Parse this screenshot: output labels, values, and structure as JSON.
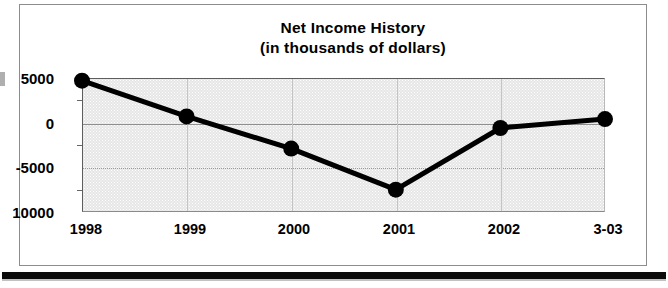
{
  "chart_data": {
    "type": "line",
    "title": "Net Income History",
    "subtitle": "(in thousands of dollars)",
    "xlabel": "",
    "ylabel": "",
    "categories": [
      "1998",
      "1999",
      "2000",
      "2001",
      "2002",
      "3-03"
    ],
    "values": [
      4700,
      700,
      -2900,
      -7500,
      -600,
      400
    ],
    "series": [
      {
        "name": "Net Income",
        "values": [
          4700,
          700,
          -2900,
          -7500,
          -600,
          400
        ]
      }
    ],
    "ylim": [
      -10000,
      5000
    ],
    "ytick_labels": [
      "5000",
      "0",
      "-5000",
      "10000"
    ],
    "ytick_values": [
      5000,
      0,
      -5000,
      -10000
    ],
    "grid": true,
    "legend": "none",
    "marker": "filled-circle",
    "line_color": "#000000",
    "marker_color": "#000000",
    "plot_background": "#e6e6e6"
  },
  "figure": {
    "title": "Net Income History",
    "subtitle": "(in thousands of dollars)",
    "y_axis": {
      "ticks": [
        {
          "label": "5000",
          "value": 5000
        },
        {
          "label": "0",
          "value": 0
        },
        {
          "label": "-5000",
          "value": -5000
        },
        {
          "label": "10000",
          "value": -10000
        }
      ]
    },
    "x_axis": {
      "ticks": [
        {
          "label": "1998"
        },
        {
          "label": "1999"
        },
        {
          "label": "2000"
        },
        {
          "label": "2001"
        },
        {
          "label": "2002"
        },
        {
          "label": "3-03"
        }
      ]
    }
  }
}
